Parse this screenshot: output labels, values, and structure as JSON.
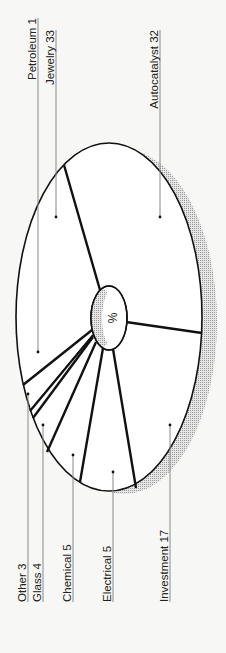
{
  "chart_data": {
    "type": "pie",
    "title": "",
    "unit_label": "%",
    "orientation": "rotated -90deg (labels read bottom-to-top)",
    "style": "3D oval pie with drop shadow, leader lines to labels",
    "slices": [
      {
        "name": "Autocatalyst",
        "value": 32,
        "label": "Autocatalyst 32"
      },
      {
        "name": "Jewelry",
        "value": 33,
        "label": "Jewelry 33"
      },
      {
        "name": "Petroleum",
        "value": 1,
        "label": "Petroleum 1"
      },
      {
        "name": "Other",
        "value": 3,
        "label": "Other 3"
      },
      {
        "name": "Glass",
        "value": 4,
        "label": "Glass 4"
      },
      {
        "name": "Chemical",
        "value": 5,
        "label": "Chemical 5"
      },
      {
        "name": "Electrical",
        "value": 5,
        "label": "Electrical 5"
      },
      {
        "name": "Investment",
        "value": 17,
        "label": "Investment 17"
      }
    ],
    "categories": [
      "Autocatalyst",
      "Jewelry",
      "Petroleum",
      "Other",
      "Glass",
      "Chemical",
      "Electrical",
      "Investment"
    ],
    "values": [
      32,
      33,
      1,
      3,
      4,
      5,
      5,
      17
    ],
    "total": 100,
    "colors": {
      "background": "#f7f7f5",
      "slice_fill": "#ffffff",
      "outline": "#111111",
      "shadow": "#c8c8c8",
      "hub": "#d6d6d6",
      "leader": "#8a8a8a"
    }
  },
  "labels": {
    "top": [
      {
        "text": "Petroleum 1",
        "x": 38,
        "textEnd": 18,
        "dotY": 352,
        "lineTop": 18
      },
      {
        "text": "Jewelry 33",
        "x": 56,
        "textEnd": 30,
        "dotY": 217,
        "lineTop": 30
      },
      {
        "text": "Autocatalyst 32",
        "x": 160,
        "textEnd": 30,
        "dotY": 217,
        "lineTop": 30
      }
    ],
    "bottom": [
      {
        "text": "Other 3",
        "x": 28,
        "dotY": 394,
        "lineBottom": 602
      },
      {
        "text": "Glass 4",
        "x": 43,
        "dotY": 425,
        "lineBottom": 602
      },
      {
        "text": "Chemical 5",
        "x": 73,
        "dotY": 455,
        "lineBottom": 602
      },
      {
        "text": "Electrical 5",
        "x": 113,
        "dotY": 472,
        "lineBottom": 602
      },
      {
        "text": "Investment 17",
        "x": 170,
        "dotY": 425,
        "lineBottom": 602
      }
    ]
  },
  "hub": {
    "label": "%"
  }
}
